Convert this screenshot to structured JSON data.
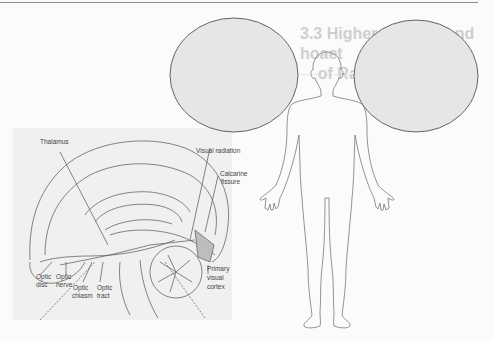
{
  "page": {
    "background_text": {
      "title_fragment": "3.3 Higher-order ... and hoaet ... of Ramier",
      "legible": false
    }
  },
  "brain_figure": {
    "labels": {
      "thalamus": "Thalamus",
      "visual_radiation": "Visual radiation",
      "calcarine_fissure_1": "Calcarine",
      "calcarine_fissure_2": "fissure",
      "primary_visual_cortex_1": "Primary",
      "primary_visual_cortex_2": "visual",
      "primary_visual_cortex_3": "cortex",
      "optic_disc_1": "Optic",
      "optic_disc_2": "disc",
      "optic_nerve_1": "Optic",
      "optic_nerve_2": "nerve",
      "optic_chiasm_1": "Optic",
      "optic_chiasm_2": "chiasm",
      "optic_tract_1": "Optic",
      "optic_tract_2": "tract"
    }
  },
  "overlay": {
    "circle_fill": "#e6e6e6",
    "circle_stroke": "#555555",
    "body_stroke": "#777777"
  }
}
